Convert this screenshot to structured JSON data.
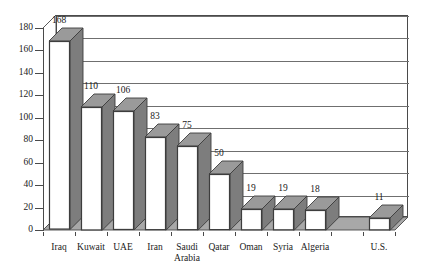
{
  "chart_data": {
    "type": "bar",
    "title": "",
    "subtitle": "",
    "xlabel": "",
    "ylabel": "",
    "categories": [
      "Iraq",
      "Kuwait",
      "UAE",
      "Iran",
      "Saudi\nArabia",
      "Qatar",
      "Oman",
      "Syria",
      "Algeria",
      "",
      "U.S."
    ],
    "values": [
      168,
      110,
      106,
      83,
      75,
      50,
      19,
      19,
      18,
      null,
      11
    ],
    "data_labels": [
      "168",
      "110",
      "106",
      "83",
      "75",
      "50",
      "19",
      "19",
      "18",
      "",
      "11"
    ],
    "ylim": [
      0,
      180
    ],
    "ytick_step": 20,
    "ytick_labels": [
      "0",
      "20",
      "40",
      "60",
      "80",
      "100",
      "120",
      "140",
      "160",
      "180"
    ],
    "ytick_values": [
      0,
      20,
      40,
      60,
      80,
      100,
      120,
      140,
      160,
      180
    ],
    "grid": true,
    "grid_axis": "y",
    "legend": false,
    "legend_position": "none",
    "series": [
      {
        "name": "",
        "values": [
          168,
          110,
          106,
          83,
          75,
          50,
          19,
          19,
          18,
          null,
          11
        ]
      }
    ],
    "annotations": [],
    "style": {
      "three_d": true,
      "bar_face_color": "#ffffff",
      "bar_side_color": "#7d7d7d",
      "bar_top_color": "#9a9a9a",
      "bar_edge_color": "#3d3d3d",
      "floor_color": "#a8a8a8",
      "plot_bg_color": "#ffffff",
      "grid_color": "#6f6f6f",
      "axis_color": "#4a4a4a",
      "text_color": "#1a1a1a"
    }
  },
  "meta": {
    "ytick_count": 10,
    "category_count": 11
  }
}
